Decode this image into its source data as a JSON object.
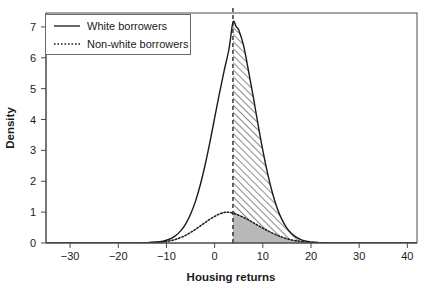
{
  "chart_data": {
    "type": "area",
    "title": "",
    "xlabel": "Housing returns",
    "ylabel": "Density",
    "xlim": [
      -35,
      42
    ],
    "ylim": [
      0,
      7.45
    ],
    "xticks": [
      -30,
      -20,
      -10,
      0,
      10,
      20,
      30,
      40
    ],
    "xtick_labels": [
      "−30",
      "−20",
      "−10",
      "0",
      "10",
      "20",
      "30",
      "40"
    ],
    "yticks": [
      0,
      1,
      2,
      3,
      4,
      5,
      6,
      7
    ],
    "ytick_labels": [
      "0",
      "1",
      "2",
      "3",
      "4",
      "5",
      "6",
      "7"
    ],
    "grid": false,
    "legend_position": "top-left",
    "annotations": {
      "vertical_line_x": 3.8,
      "vertical_line_style": "dashed",
      "shaded_region_from_x": 3.8,
      "shaded_region_to_x": 42,
      "shade_upper_hatched": "between non-white curve and white curve",
      "shade_lower_solid": "under non-white curve",
      "hatch_color": "#9a9a9a",
      "fill_color": "#b5b5b5"
    },
    "series": [
      {
        "name": "White borrowers",
        "style": "solid",
        "color": "#1a1a1a",
        "distribution": "normal",
        "peak_x": 3.8,
        "peak_y": 7.15,
        "sigma": 4.45,
        "x": [
          -35,
          -30,
          -25,
          -20,
          -16,
          -14,
          -12,
          -11,
          -10,
          -9,
          -8,
          -7,
          -6,
          -5,
          -4,
          -3,
          -2,
          -1,
          0,
          1,
          2,
          3,
          3.8,
          4.5,
          5,
          6,
          7,
          8,
          9,
          10,
          11,
          12,
          13,
          14,
          15,
          16,
          17,
          18,
          19,
          20,
          21,
          22,
          24,
          26,
          30,
          35,
          40,
          42
        ],
        "y": [
          0.0,
          0.0,
          0.0,
          0.0,
          0.0,
          0.01,
          0.03,
          0.05,
          0.09,
          0.15,
          0.25,
          0.4,
          0.62,
          0.93,
          1.34,
          1.87,
          2.51,
          3.25,
          4.05,
          4.85,
          5.6,
          6.3,
          7.15,
          7.0,
          6.9,
          6.4,
          5.6,
          4.75,
          3.85,
          3.0,
          2.25,
          1.62,
          1.12,
          0.75,
          0.48,
          0.3,
          0.18,
          0.1,
          0.06,
          0.03,
          0.02,
          0.01,
          0.0,
          0.0,
          0.0,
          0.0,
          0.0,
          0.0
        ]
      },
      {
        "name": "Non-white borrowers",
        "style": "dotted",
        "color": "#1a1a1a",
        "distribution": "normal",
        "peak_x": 2.6,
        "peak_y": 1.0,
        "sigma": 6.2,
        "x": [
          -35,
          -30,
          -25,
          -20,
          -16,
          -14,
          -12,
          -11,
          -10,
          -9,
          -8,
          -7,
          -6,
          -5,
          -4,
          -3,
          -2,
          -1,
          0,
          1,
          2,
          2.6,
          3.8,
          5,
          6,
          7,
          8,
          9,
          10,
          11,
          12,
          13,
          14,
          15,
          16,
          17,
          18,
          19,
          20,
          21,
          22,
          24,
          26,
          30,
          35,
          40,
          42
        ],
        "y": [
          0.0,
          0.0,
          0.0,
          0.0,
          0.0,
          0.01,
          0.02,
          0.03,
          0.05,
          0.08,
          0.12,
          0.18,
          0.25,
          0.34,
          0.44,
          0.55,
          0.66,
          0.77,
          0.86,
          0.94,
          0.99,
          1.0,
          0.97,
          0.9,
          0.83,
          0.75,
          0.66,
          0.57,
          0.48,
          0.4,
          0.32,
          0.25,
          0.19,
          0.14,
          0.1,
          0.07,
          0.05,
          0.035,
          0.024,
          0.016,
          0.01,
          0.004,
          0.002,
          0.0,
          0.0,
          0.0,
          0.0
        ]
      }
    ],
    "legend": [
      {
        "label": "White borrowers",
        "style": "solid"
      },
      {
        "label": "Non-white borrowers",
        "style": "dotted"
      }
    ]
  }
}
